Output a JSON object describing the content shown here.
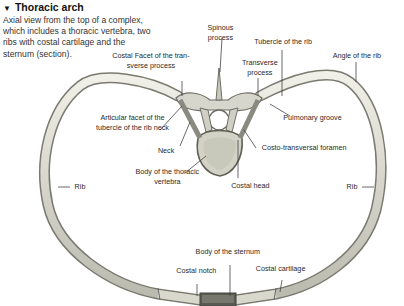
{
  "header": {
    "title": "Thoracic arch",
    "marker": "▼",
    "description": "Axial view from the top of a complex, which includes a thoracic vertebra, two ribs with costal cartilage and the sternum (section)."
  },
  "labels": {
    "spinous_process_1": "Spinous",
    "spinous_process_2": "process",
    "costal_facet_1": "Costal Facet of the tran-",
    "costal_facet_2": "sverse process",
    "tubercle_rib": "Tubercle of the rib",
    "transverse_process_1": "Transverse",
    "transverse_process_2": "process",
    "angle_rib": "Angle of the rib",
    "articular_facet_1": "Articular facet of the",
    "articular_facet_2": "tubercle of the rib neck",
    "pulmonary_groove": "Pulmonary groove",
    "neck": "Neck",
    "costo_transversal_foramen": "Costo-transversal foramen",
    "body_vertebra_1": "Body of the thoracic",
    "body_vertebra_2": "vertebra",
    "costal_head": "Costal head",
    "rib_left": "Rib",
    "rib_right": "Rib",
    "body_sternum": "Body of the sternum",
    "costal_notch": "Costal notch",
    "costal_cartilage": "Costal cartilage"
  },
  "colors": {
    "bone": "#dcdcd2",
    "bone_edge": "#7a7a70",
    "leader": "#444444"
  }
}
